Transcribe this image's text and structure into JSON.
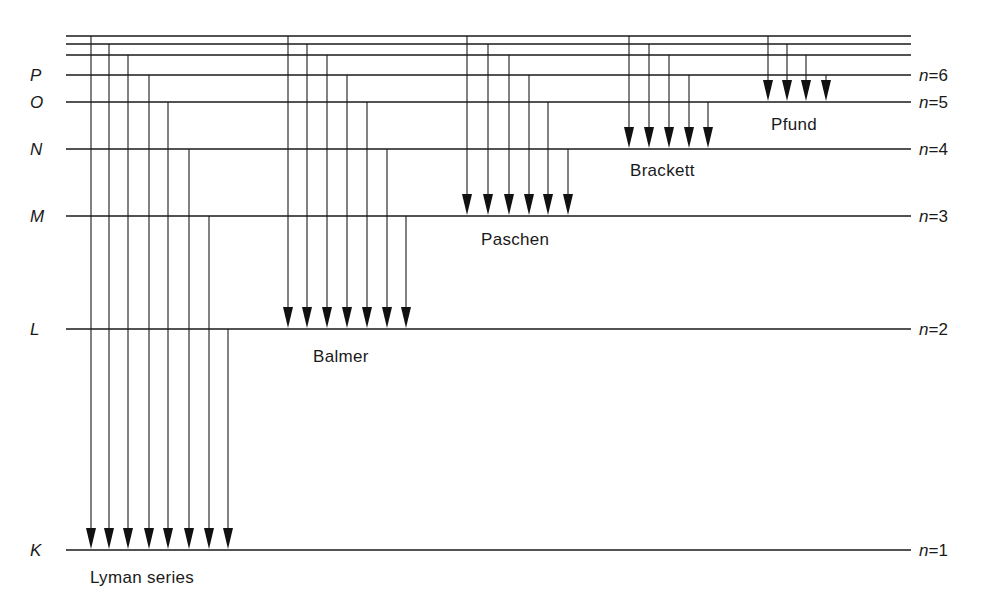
{
  "diagram": {
    "colors": {
      "ink": "#1a1a1a",
      "background": "#ffffff"
    },
    "level_x_start": 66,
    "level_x_end": 911,
    "levels": [
      {
        "n": 1,
        "shell": "K",
        "y": 550,
        "label": "n=1"
      },
      {
        "n": 2,
        "shell": "L",
        "y": 329,
        "label": "n=2"
      },
      {
        "n": 3,
        "shell": "M",
        "y": 216,
        "label": "n=3"
      },
      {
        "n": 4,
        "shell": "N",
        "y": 149,
        "label": "n=4"
      },
      {
        "n": 5,
        "shell": "O",
        "y": 102,
        "label": "n=5"
      },
      {
        "n": 6,
        "shell": "P",
        "y": 75,
        "label": "n=6"
      },
      {
        "n": 7,
        "shell": "",
        "y": 55,
        "label": ""
      },
      {
        "n": 8,
        "shell": "",
        "y": 44,
        "label": ""
      },
      {
        "n": 9,
        "shell": "",
        "y": 36,
        "label": ""
      }
    ],
    "series": [
      {
        "name": "Lyman series",
        "final_n": 1,
        "label_x": 90,
        "label_y": 583,
        "transitions": [
          {
            "from_n": 9,
            "x": 91
          },
          {
            "from_n": 8,
            "x": 109
          },
          {
            "from_n": 7,
            "x": 128
          },
          {
            "from_n": 6,
            "x": 149
          },
          {
            "from_n": 5,
            "x": 168
          },
          {
            "from_n": 4,
            "x": 189
          },
          {
            "from_n": 3,
            "x": 209
          },
          {
            "from_n": 2,
            "x": 228
          }
        ]
      },
      {
        "name": "Balmer",
        "final_n": 2,
        "label_x": 313,
        "label_y": 362,
        "transitions": [
          {
            "from_n": 9,
            "x": 288
          },
          {
            "from_n": 8,
            "x": 307
          },
          {
            "from_n": 7,
            "x": 327
          },
          {
            "from_n": 6,
            "x": 347
          },
          {
            "from_n": 5,
            "x": 367
          },
          {
            "from_n": 4,
            "x": 387
          },
          {
            "from_n": 3,
            "x": 406
          }
        ]
      },
      {
        "name": "Paschen",
        "final_n": 3,
        "label_x": 481,
        "label_y": 245,
        "transitions": [
          {
            "from_n": 9,
            "x": 467
          },
          {
            "from_n": 8,
            "x": 488
          },
          {
            "from_n": 7,
            "x": 509
          },
          {
            "from_n": 6,
            "x": 529
          },
          {
            "from_n": 5,
            "x": 548
          },
          {
            "from_n": 4,
            "x": 568
          }
        ]
      },
      {
        "name": "Brackett",
        "final_n": 4,
        "label_x": 630,
        "label_y": 176,
        "transitions": [
          {
            "from_n": 9,
            "x": 629
          },
          {
            "from_n": 8,
            "x": 649
          },
          {
            "from_n": 7,
            "x": 669
          },
          {
            "from_n": 6,
            "x": 689
          },
          {
            "from_n": 5,
            "x": 708
          }
        ]
      },
      {
        "name": "Pfund",
        "final_n": 5,
        "label_x": 771,
        "label_y": 130,
        "transitions": [
          {
            "from_n": 9,
            "x": 768
          },
          {
            "from_n": 8,
            "x": 787
          },
          {
            "from_n": 7,
            "x": 806
          },
          {
            "from_n": 6,
            "x": 826
          }
        ]
      }
    ]
  }
}
